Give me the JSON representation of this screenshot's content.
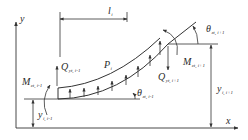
{
  "figure": {
    "stroke_color": "#333333",
    "background": "#ffffff"
  },
  "labels": {
    "y_axis": "y",
    "x_axis": "x",
    "length": {
      "main": "l",
      "sub": "i"
    },
    "load": {
      "main": "P",
      "sub": "i"
    },
    "shear_left": {
      "main": "Q",
      "sub": "yt, i-1"
    },
    "shear_right": {
      "main": "Q",
      "sub": "yt, i+1"
    },
    "moment_left": {
      "main": "M",
      "sub": "zt, i-1"
    },
    "moment_right": {
      "main": "M",
      "sub": "zt, i+1"
    },
    "theta_left": {
      "main": "θ",
      "sub": "zt, i-1"
    },
    "theta_right": {
      "main": "θ",
      "sub": "zt, i+1"
    },
    "y_left": {
      "main": "y",
      "sub": "i, i-1"
    },
    "y_right": {
      "main": "y",
      "sub": "i, i+1"
    }
  }
}
